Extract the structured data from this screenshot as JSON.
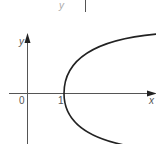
{
  "diagram": {
    "type": "function-graph",
    "axes": {
      "x_label": "x",
      "y_label": "y",
      "origin_label": "0"
    },
    "ticks": {
      "x_tick_label": "1"
    },
    "curve": {
      "shape": "parabola",
      "vertex": [
        1,
        0
      ],
      "opens": "right"
    },
    "top_fragment": {
      "label": "y"
    },
    "colors": {
      "axis": "#555555",
      "curve": "#222222",
      "text": "#555555"
    }
  }
}
